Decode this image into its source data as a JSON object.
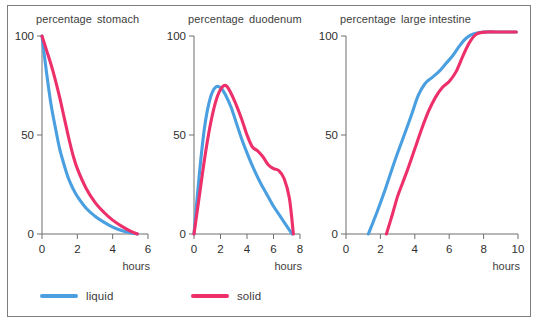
{
  "figure": {
    "legend": {
      "position": "bottom-left",
      "entries": [
        {
          "label": "liquid",
          "color": "#4a9fe0"
        },
        {
          "label": "solid",
          "color": "#ed2f6a"
        }
      ]
    }
  },
  "chart_data": [
    {
      "type": "line",
      "title": "stomach",
      "ylabel": "percentage",
      "xlabel": "hours",
      "xlim": [
        0,
        6
      ],
      "ylim": [
        0,
        100
      ],
      "xticks": [
        0,
        2,
        4,
        6
      ],
      "yticks": [
        0,
        50,
        100
      ],
      "grid": false,
      "series": [
        {
          "name": "liquid",
          "color": "#4a9fe0",
          "x": [
            0,
            0.25,
            0.5,
            0.75,
            1.0,
            1.25,
            1.5,
            1.75,
            2.0,
            2.5,
            3.0,
            3.5,
            4.0,
            4.5,
            5.0,
            5.4
          ],
          "values": [
            100,
            82,
            66,
            54,
            43,
            35,
            28,
            23,
            19,
            13,
            9,
            6,
            3.5,
            1.8,
            0.6,
            0
          ]
        },
        {
          "name": "solid",
          "color": "#ed2f6a",
          "x": [
            0,
            0.25,
            0.5,
            0.75,
            1.0,
            1.25,
            1.5,
            1.75,
            2.0,
            2.5,
            3.0,
            3.5,
            4.0,
            4.5,
            5.0,
            5.4
          ],
          "values": [
            100,
            93,
            86,
            78,
            69,
            59,
            49,
            40,
            33,
            23,
            16,
            11,
            7,
            4,
            1.5,
            0
          ]
        }
      ]
    },
    {
      "type": "line",
      "title": "duodenum",
      "ylabel": "percentage",
      "xlabel": "hours",
      "xlim": [
        0,
        8
      ],
      "ylim": [
        0,
        100
      ],
      "xticks": [
        0,
        2,
        4,
        6,
        8
      ],
      "yticks": [
        0,
        50,
        100
      ],
      "grid": false,
      "series": [
        {
          "name": "liquid",
          "color": "#4a9fe0",
          "x": [
            0,
            0.4,
            0.8,
            1.2,
            1.6,
            2.0,
            2.4,
            2.8,
            3.2,
            3.6,
            4.0,
            4.5,
            5.0,
            5.5,
            6.0,
            6.5,
            7.0,
            7.4
          ],
          "values": [
            0,
            30,
            54,
            68,
            74,
            74,
            70,
            64,
            56,
            48,
            41,
            33,
            26,
            20,
            14,
            9,
            4,
            0
          ]
        },
        {
          "name": "solid",
          "color": "#ed2f6a",
          "x": [
            0,
            0.4,
            0.8,
            1.2,
            1.6,
            2.0,
            2.4,
            2.8,
            3.2,
            3.6,
            4.0,
            4.4,
            4.8,
            5.2,
            5.6,
            6.0,
            6.4,
            6.8,
            7.2,
            7.5
          ],
          "values": [
            0,
            19,
            38,
            54,
            66,
            73,
            75,
            71,
            65,
            58,
            50,
            44,
            42,
            39,
            35,
            33,
            32,
            28,
            18,
            0
          ]
        }
      ]
    },
    {
      "type": "line",
      "title": "large intestine",
      "ylabel": "percentage",
      "xlabel": "hours",
      "xlim": [
        0,
        10
      ],
      "ylim": [
        0,
        100
      ],
      "xticks": [
        0,
        2,
        4,
        6,
        8,
        10
      ],
      "yticks": [
        0,
        50,
        100
      ],
      "grid": false,
      "series": [
        {
          "name": "liquid",
          "color": "#4a9fe0",
          "x": [
            1.3,
            1.8,
            2.3,
            2.8,
            3.3,
            3.8,
            4.2,
            4.6,
            5.0,
            5.4,
            5.8,
            6.2,
            6.6,
            7.0,
            7.4,
            8.0,
            9.0,
            9.9
          ],
          "values": [
            0,
            11,
            23,
            36,
            48,
            60,
            70,
            76,
            79,
            82,
            86,
            90,
            95,
            99,
            101,
            102,
            102,
            102
          ]
        },
        {
          "name": "solid",
          "color": "#ed2f6a",
          "x": [
            2.35,
            2.7,
            3.0,
            3.3,
            3.6,
            4.0,
            4.4,
            4.8,
            5.2,
            5.6,
            6.0,
            6.4,
            6.8,
            7.2,
            7.6,
            8.2,
            9.0,
            9.9
          ],
          "values": [
            0,
            10,
            19,
            26,
            33,
            43,
            53,
            62,
            69,
            74,
            77,
            82,
            90,
            97,
            101,
            102,
            102,
            102
          ]
        }
      ]
    }
  ]
}
